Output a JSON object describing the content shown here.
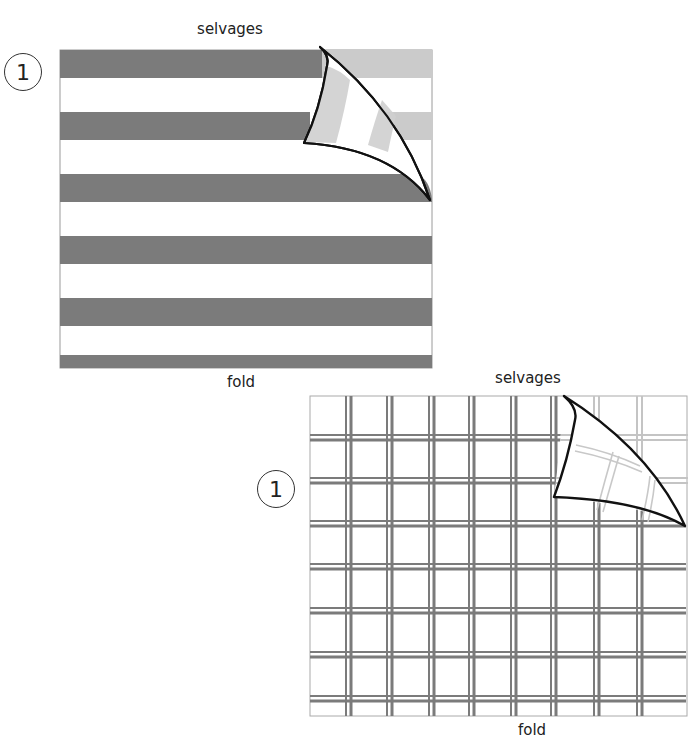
{
  "figures": [
    {
      "id": "striped-fabric",
      "step_number": "1",
      "top_label": "selvages",
      "bottom_label": "fold",
      "pattern": "horizontal stripes",
      "colors": {
        "stripe_dark": "#7b7b7b",
        "stripe_underside": "#cbcbcb",
        "background": "#ffffff",
        "curl_outline": "#111111"
      }
    },
    {
      "id": "plaid-fabric",
      "step_number": "1",
      "top_label": "selvages",
      "bottom_label": "fold",
      "pattern": "plaid / grid",
      "colors": {
        "line_dark": "#7b7b7b",
        "line_underside": "#c4c4c4",
        "background": "#ffffff",
        "curl_outline": "#111111"
      }
    }
  ]
}
